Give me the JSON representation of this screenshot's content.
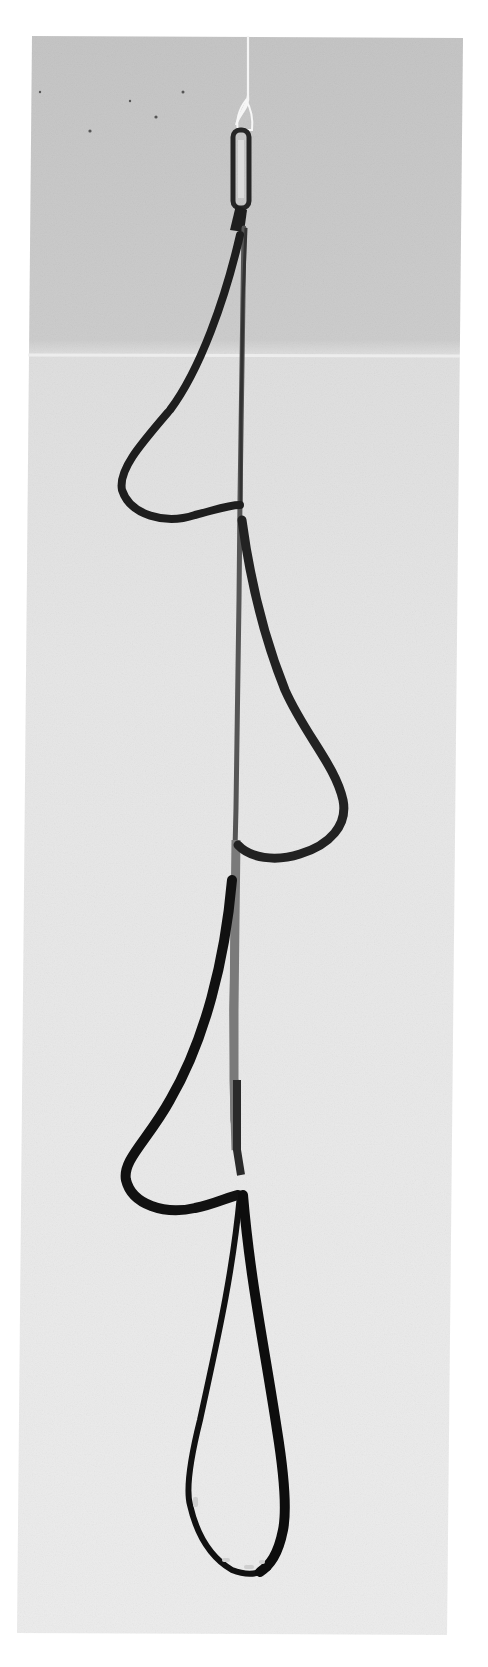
{
  "image": {
    "subject": "Webbing ladder (aider / étrier) hanging from a carabiner",
    "style": "grayscale photograph",
    "loops": [
      {
        "index": 1,
        "side": "left"
      },
      {
        "index": 2,
        "side": "right"
      },
      {
        "index": 3,
        "side": "left"
      },
      {
        "index": 4,
        "side": "bottom"
      }
    ],
    "colors": {
      "page_background": "#ffffff",
      "backdrop_top": "#c6c6c6",
      "backdrop_bottom": "#e9e9e9",
      "webbing": "#1c1c1c",
      "webbing_light": "#6a6a6a",
      "cord": "#f4f4f4",
      "carabiner": "#2a2a2a"
    }
  }
}
